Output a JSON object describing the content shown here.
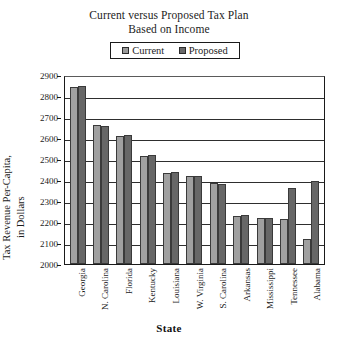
{
  "chart_data": {
    "type": "bar",
    "title": "Current versus Proposed Tax Plan",
    "subtitle": "Based on Income",
    "xlabel": "State",
    "ylabel_line1": "Tax Revenue Per-Capita,",
    "ylabel_line2": "in Dollars",
    "ylim": [
      2000,
      2900
    ],
    "ytick_step": 100,
    "yticks": [
      2900,
      2800,
      2700,
      2600,
      2500,
      2400,
      2300,
      2200,
      2100,
      2000
    ],
    "grid": true,
    "grid_axis": "y",
    "legend_position": "top-center",
    "categories": [
      "Georgia",
      "N. Carolina",
      "Florida",
      "Kentucky",
      "Louisiana",
      "W. Virginia",
      "S. Carolina",
      "Arkansas",
      "Mississippi",
      "Tennessee",
      "Alabama"
    ],
    "series": [
      {
        "name": "Current",
        "color": "#a0a0a0",
        "values": [
          2845,
          2660,
          2610,
          2515,
          2435,
          2420,
          2385,
          2230,
          2220,
          2215,
          2120
        ]
      },
      {
        "name": "Proposed",
        "color": "#676767",
        "values": [
          2848,
          2658,
          2612,
          2518,
          2440,
          2418,
          2383,
          2232,
          2218,
          2360,
          2395
        ]
      }
    ]
  },
  "legend": {
    "entries": [
      {
        "label": "Current",
        "swatch": "legend-swatch-current"
      },
      {
        "label": "Proposed",
        "swatch": "legend-swatch-proposed"
      }
    ]
  }
}
